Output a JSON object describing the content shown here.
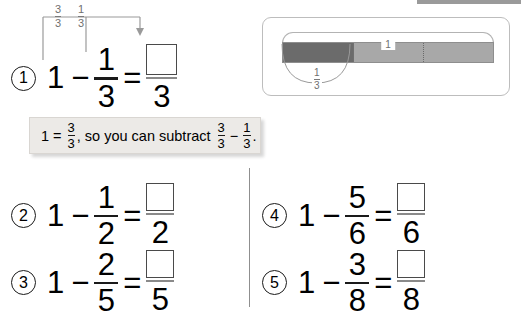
{
  "worksheet": {
    "hint": {
      "lead_whole": "1",
      "equals": "=",
      "equiv_num": "3",
      "equiv_den": "3",
      "middle_text": ", so you can subtract",
      "sub_a_num": "3",
      "sub_a_den": "3",
      "minus": "−",
      "sub_b_num": "1",
      "sub_b_den": "3",
      "period": "."
    },
    "annotation": {
      "label_a_num": "3",
      "label_a_den": "3",
      "label_b_num": "1",
      "label_b_den": "3"
    },
    "bar_model": {
      "whole_label": "1",
      "part_num": "1",
      "part_den": "3",
      "shaded_color": "#6b6b6b",
      "unshaded_color": "#a8a8a8",
      "segments": 3,
      "shaded_segments": 1
    },
    "problems": [
      {
        "number": "1",
        "whole": "1",
        "operator": "−",
        "sub_num": "1",
        "sub_den": "3",
        "equals": "=",
        "answer_num": "",
        "answer_den": "3"
      },
      {
        "number": "2",
        "whole": "1",
        "operator": "−",
        "sub_num": "1",
        "sub_den": "2",
        "equals": "=",
        "answer_num": "",
        "answer_den": "2"
      },
      {
        "number": "3",
        "whole": "1",
        "operator": "−",
        "sub_num": "2",
        "sub_den": "5",
        "equals": "=",
        "answer_num": "",
        "answer_den": "5"
      },
      {
        "number": "4",
        "whole": "1",
        "operator": "−",
        "sub_num": "5",
        "sub_den": "6",
        "equals": "=",
        "answer_num": "",
        "answer_den": "6"
      },
      {
        "number": "5",
        "whole": "1",
        "operator": "−",
        "sub_num": "3",
        "sub_den": "8",
        "equals": "=",
        "answer_num": "",
        "answer_den": "8"
      }
    ]
  }
}
